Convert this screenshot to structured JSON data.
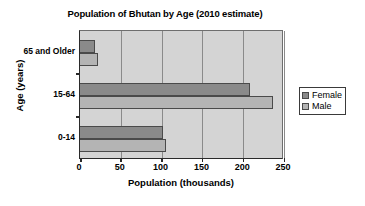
{
  "chart_data": {
    "type": "bar",
    "orientation": "horizontal",
    "title": "Population of Bhutan by Age (2010 estimate)",
    "xlabel": "Population (thousands)",
    "ylabel": "Age (years)",
    "categories": [
      "0-14",
      "15-64",
      "65 and Older"
    ],
    "series": [
      {
        "name": "Female",
        "color": "#8a8a8a",
        "values": [
          102,
          208,
          18
        ]
      },
      {
        "name": "Male",
        "color": "#b4b4b4",
        "values": [
          105,
          237,
          22
        ]
      }
    ],
    "xlim": [
      0,
      250
    ],
    "xticks": [
      0,
      50,
      100,
      150,
      200,
      250
    ],
    "xtick_labels": [
      "0",
      "50",
      "100",
      "150",
      "200",
      "250"
    ],
    "grid": "vertical",
    "legend_position": "right",
    "plot_background": "#d4d4d4"
  }
}
